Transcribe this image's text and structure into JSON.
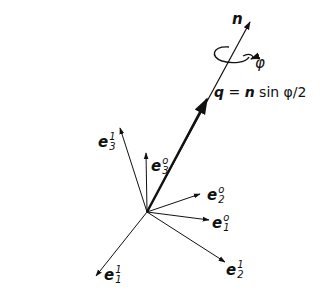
{
  "diagram": {
    "type": "vector-rotation-diagram",
    "colors": {
      "ink": "#111111",
      "background": "#ffffff"
    },
    "origin": {
      "x": 147,
      "y": 212
    },
    "axis_n": {
      "label": "n",
      "tip": {
        "x": 250,
        "y": 22
      }
    },
    "rotation_angle": {
      "label": "φ"
    },
    "vector_q": {
      "label_q": "q",
      "equals": "=",
      "label_n": "n",
      "expr": "sin φ/2",
      "tip": {
        "x": 207,
        "y": 98
      }
    },
    "basis_vectors": [
      {
        "name": "e3-1",
        "base": "e",
        "sup": "1",
        "sub": "3",
        "tip": {
          "x": 120,
          "y": 128
        }
      },
      {
        "name": "e3-0",
        "base": "e",
        "sup": "o",
        "sub": "3",
        "tip": {
          "x": 146,
          "y": 153
        }
      },
      {
        "name": "e2-0",
        "base": "e",
        "sup": "o",
        "sub": "2",
        "tip": {
          "x": 200,
          "y": 194
        }
      },
      {
        "name": "e1-0",
        "base": "e",
        "sup": "o",
        "sub": "1",
        "tip": {
          "x": 209,
          "y": 220
        }
      },
      {
        "name": "e2-1",
        "base": "e",
        "sup": "1",
        "sub": "2",
        "tip": {
          "x": 225,
          "y": 262
        }
      },
      {
        "name": "e1-1",
        "base": "e",
        "sup": "1",
        "sub": "1",
        "tip": {
          "x": 96,
          "y": 276
        }
      }
    ]
  }
}
